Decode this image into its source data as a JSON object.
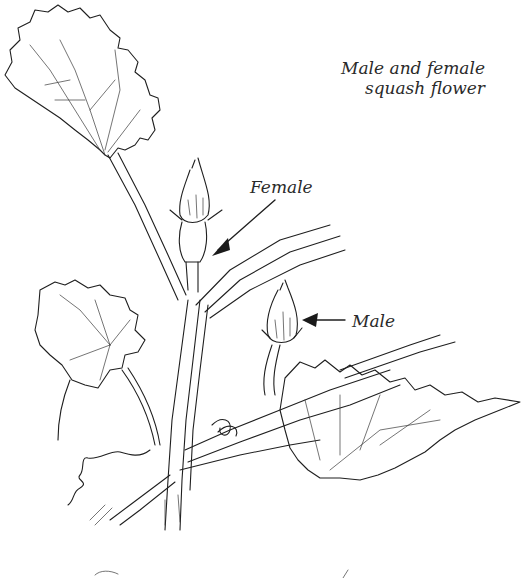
{
  "figure": {
    "caption_line1": "Male and female",
    "caption_line2": "squash flower",
    "labels": {
      "female": "Female",
      "male": "Male"
    }
  }
}
